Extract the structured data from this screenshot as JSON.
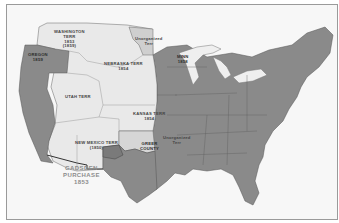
{
  "map": {
    "title": "United States Territories, 1850s",
    "colors": {
      "states": "#8a8a8a",
      "territories": "#e9e9e9",
      "unorganized": "#cfcfcf",
      "water_lakes": "#f0f0f0",
      "background": "#f7f7f7",
      "border": "#9a9a9a"
    },
    "labels": {
      "washington": {
        "name": "WASHINGTON",
        "line2": "TERR",
        "year": "1853",
        "year2": "(1859)"
      },
      "oregon": {
        "name": "OREGON",
        "year": "1859"
      },
      "nebraska": {
        "name": "NEBRASKA TERR",
        "year": "1854"
      },
      "unorganized_north": {
        "name": "Unorganized",
        "line2": "Terr"
      },
      "minn": {
        "name": "MINN",
        "year": "1858"
      },
      "utah": {
        "name": "UTAH TERR"
      },
      "kansas": {
        "name": "KANSAS TERR",
        "year": "1854"
      },
      "unorganized_south": {
        "name": "Unorganized",
        "line2": "Terr"
      },
      "greer": {
        "name": "GREER",
        "line2": "COUNTY"
      },
      "new_mexico": {
        "name": "NEW MEXICO TERR",
        "year": "(1850)"
      },
      "gadsden": {
        "name": "GADSDEN",
        "line2": "PURCHASE",
        "year": "1853"
      }
    }
  }
}
